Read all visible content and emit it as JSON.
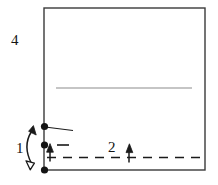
{
  "figure": {
    "background_color": "#ffffff",
    "ink_color": "#1a1a1a",
    "secondary_line_color": "#8c8c8c",
    "width": 218,
    "height": 185
  },
  "labels": {
    "callout_4": "4",
    "callout_1": "1",
    "callout_2": "2"
  },
  "shapes": {
    "outer_rectangle": {
      "name": "outer-rectangle",
      "x": 44,
      "y": 8,
      "width": 161,
      "height": 162,
      "stroke": "#3a3a3a",
      "stroke_width": 1.4,
      "fill": "none"
    },
    "interior_horizontal_line": {
      "name": "interior-horizontal-line",
      "x1": 56,
      "y1": 88,
      "x2": 192,
      "y2": 88,
      "stroke": "#8c8c8c",
      "stroke_width": 1.2
    },
    "dashed_horizontal_line": {
      "name": "dashed-horizontal-line",
      "x1": 47,
      "y1": 157.5,
      "x2": 205,
      "y2": 157.5,
      "stroke": "#1a1a1a",
      "stroke_width": 1.6,
      "dash_pattern": "9 7"
    },
    "leader_line_top": {
      "name": "leader-line-top",
      "x1": 45,
      "y1": 127,
      "x2": 73,
      "y2": 130.5,
      "stroke": "#1a1a1a",
      "stroke_width": 1.1
    },
    "short_dash_middle": {
      "name": "short-dash-middle",
      "x1": 57,
      "y1": 145,
      "x2": 69,
      "y2": 145,
      "stroke": "#1a1a1a",
      "stroke_width": 1.6
    }
  },
  "points": [
    {
      "name": "node-top",
      "x": 44.5,
      "y": 126.5,
      "radius": 3.6
    },
    {
      "name": "node-middle",
      "x": 44.5,
      "y": 145.0,
      "radius": 3.6
    },
    {
      "name": "node-bottom",
      "x": 44.5,
      "y": 170.0,
      "radius": 3.6
    }
  ],
  "arrows": [
    {
      "name": "double-headed-arrow-1",
      "kind": "curved-double-headed",
      "from_x": 30,
      "from_y": 168,
      "to_x": 33,
      "to_y": 126,
      "head_top": "filled",
      "head_bottom": "hollow"
    },
    {
      "name": "up-arrow-middle",
      "kind": "straight-up",
      "x": 50,
      "y_tail": 161,
      "y_head": 144,
      "head": "filled"
    },
    {
      "name": "up-arrow-2",
      "kind": "straight-up",
      "x": 129,
      "y_tail": 162,
      "y_head": 144,
      "head": "filled"
    }
  ],
  "label_positions": {
    "callout_4": {
      "x": 11,
      "y": 45
    },
    "callout_1": {
      "x": 16,
      "y": 153
    },
    "callout_2": {
      "x": 108,
      "y": 152
    }
  }
}
